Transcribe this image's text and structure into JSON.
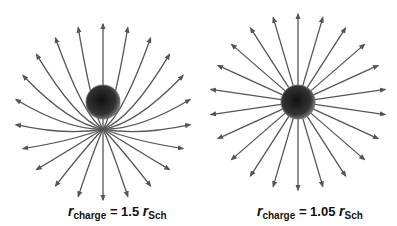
{
  "panels": [
    {
      "id": "left",
      "caption": {
        "symbol": "r",
        "subscript": "charge",
        "equals": "= 1.5",
        "rhs_symbol": "r",
        "rhs_subscript": "Sch"
      },
      "sphere": {
        "cx": 103,
        "cy": 102,
        "r": 17
      },
      "focus": {
        "x": 103,
        "y": 129
      },
      "num_field_lines": 22,
      "description": "Field lines bend toward the bottom and converge beneath the charge"
    },
    {
      "id": "right",
      "caption": {
        "symbol": "r",
        "subscript": "charge",
        "equals": "= 1.05",
        "rhs_symbol": "r",
        "rhs_subscript": "Sch"
      },
      "sphere": {
        "cx": 298,
        "cy": 102,
        "r": 17
      },
      "num_field_lines": 22,
      "description": "Field lines radiate nearly radially outward from the charge"
    }
  ],
  "colors": {
    "line": "#555555",
    "sphere_dark": "#111111",
    "sphere_light": "#888888"
  }
}
